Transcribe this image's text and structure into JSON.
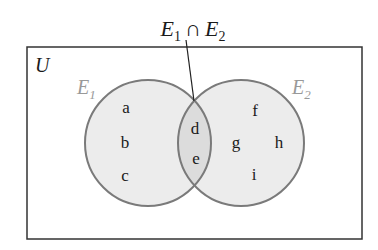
{
  "diagram": {
    "type": "venn",
    "title_label": {
      "set_a": "E",
      "sub_a": "1",
      "operator": "∩",
      "set_b": "E",
      "sub_b": "2"
    },
    "universe": {
      "label": "U"
    },
    "sets": [
      {
        "name": "E",
        "sub": "1",
        "exclusive_elements": [
          "a",
          "b",
          "c"
        ]
      },
      {
        "name": "E",
        "sub": "2",
        "exclusive_elements": [
          "f",
          "g",
          "h",
          "i"
        ]
      }
    ],
    "intersection": {
      "elements": [
        "d",
        "e"
      ]
    },
    "colors": {
      "circle_fill": "#ececec",
      "intersection_fill": "#dcdcdc",
      "circle_stroke": "#7a7a7a",
      "set_label": "#999999",
      "text": "#1a1a1a",
      "frame": "#333333"
    }
  }
}
